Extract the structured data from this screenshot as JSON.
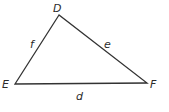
{
  "diagram": {
    "type": "triangle",
    "vertices": [
      {
        "label": "D",
        "x": 59,
        "y": 15
      },
      {
        "label": "E",
        "x": 15,
        "y": 84
      },
      {
        "label": "F",
        "x": 147,
        "y": 83
      }
    ],
    "sides": [
      {
        "label": "f",
        "from": "E",
        "to": "D"
      },
      {
        "label": "e",
        "from": "D",
        "to": "F"
      },
      {
        "label": "d",
        "from": "E",
        "to": "F"
      }
    ],
    "stroke_color": "#333333"
  },
  "labels": {
    "vertex_d": "D",
    "vertex_e": "E",
    "vertex_f": "F",
    "side_f": "f",
    "side_e": "e",
    "side_d": "d"
  }
}
